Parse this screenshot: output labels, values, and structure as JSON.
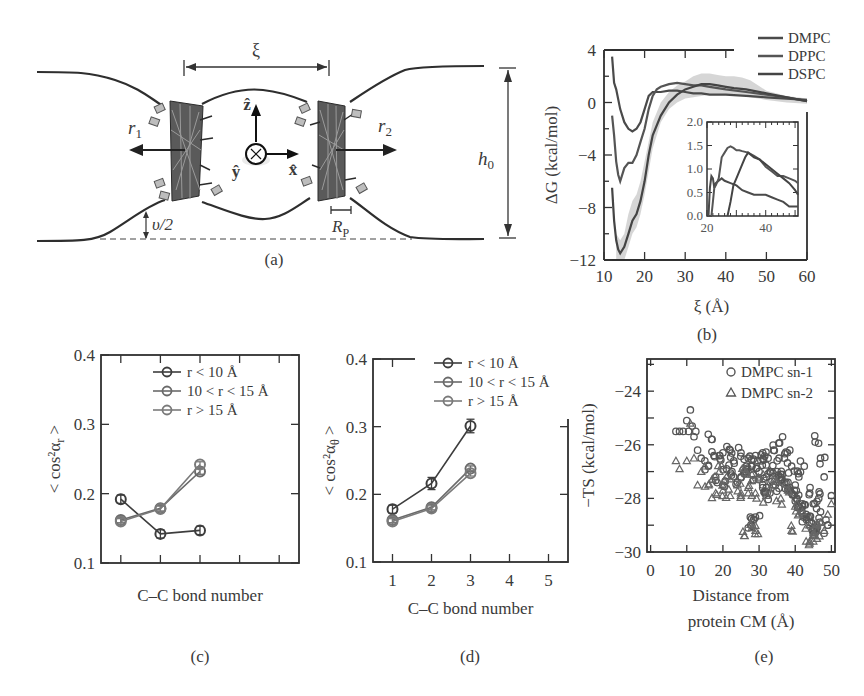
{
  "figure": {
    "panels": {
      "a": {
        "label": "(a)",
        "xi_label": "ξ",
        "r1_label": "r",
        "r1_sub": "1",
        "r2_label": "r",
        "r2_sub": "2",
        "z_label": "ẑ",
        "x_label": "x̂",
        "y_label": "ŷ",
        "h0_label": "h",
        "h0_sub": "0",
        "v_label": "υ/2",
        "rp_label": "R",
        "rp_sub": "P"
      },
      "b": {
        "label": "(b)"
      },
      "c": {
        "label": "(c)"
      },
      "d": {
        "label": "(d)"
      },
      "e": {
        "label": "(e)"
      }
    }
  },
  "colors": {
    "ink": "#3a3a3a",
    "dmpc": "#4a4a4a",
    "dppc": "#555555",
    "dspc": "#444444",
    "band": "#cfcfcf",
    "marker_dark": "#3d3d3d",
    "marker_mid": "#6a6a6a",
    "marker_light": "#7a7a7a"
  },
  "chart_data": [
    {
      "id": "b",
      "type": "line",
      "title": "",
      "xlabel": "ξ (Å)",
      "ylabel": "ΔG (kcal/mol)",
      "xlim": [
        10,
        60
      ],
      "ylim": [
        -12,
        4
      ],
      "xticks": [
        10,
        20,
        30,
        40,
        50,
        60
      ],
      "yticks": [
        4,
        0,
        -4,
        -8,
        -12
      ],
      "legend": [
        "DMPC",
        "DPPC",
        "DSPC"
      ],
      "legend_position": "top-right outside",
      "series": [
        {
          "name": "DMPC",
          "x": [
            12,
            12.5,
            13,
            14,
            15,
            16,
            17,
            18,
            19,
            20,
            21,
            22,
            24,
            26,
            28,
            30,
            32,
            34,
            36,
            38,
            40,
            45,
            50,
            55,
            60
          ],
          "y": [
            3.5,
            1.5,
            1.0,
            -0.5,
            -1.5,
            -2.0,
            -2.2,
            -2.0,
            -1.5,
            -0.5,
            0.5,
            0.8,
            0.8,
            0.9,
            0.9,
            0.8,
            0.7,
            0.7,
            0.6,
            0.6,
            0.6,
            0.5,
            0.4,
            0.3,
            0.2
          ]
        },
        {
          "name": "DPPC",
          "x": [
            12,
            12.5,
            13,
            13.5,
            14,
            15,
            16,
            17,
            18,
            19,
            20,
            21,
            22,
            23,
            24,
            26,
            28,
            30,
            32,
            34,
            36,
            38,
            40,
            45,
            50,
            55,
            60
          ],
          "y": [
            -1.0,
            -2.5,
            -4.5,
            -5.5,
            -6.0,
            -5.0,
            -4.6,
            -4.6,
            -4.0,
            -3.0,
            -2.0,
            -0.5,
            0.5,
            1.0,
            1.2,
            1.4,
            1.5,
            1.4,
            1.3,
            1.3,
            1.2,
            1.1,
            1.0,
            0.8,
            0.6,
            0.4,
            0.1
          ]
        },
        {
          "name": "DSPC",
          "x": [
            12,
            12.5,
            13,
            13.5,
            14,
            15,
            16,
            17,
            18,
            19,
            20,
            21,
            22,
            24,
            26,
            28,
            30,
            32,
            34,
            36,
            38,
            40,
            42,
            45,
            50,
            55,
            60
          ],
          "y": [
            -6.5,
            -9.0,
            -10.5,
            -11.2,
            -11.5,
            -11.0,
            -10.0,
            -9.0,
            -8.5,
            -7.5,
            -6.0,
            -4.0,
            -2.5,
            -1.0,
            0.0,
            0.6,
            1.0,
            1.2,
            1.4,
            1.4,
            1.3,
            1.2,
            1.1,
            1.0,
            0.7,
            0.4,
            0.1
          ]
        }
      ],
      "band": {
        "name": "DSPC uncertainty",
        "x": [
          13,
          14,
          15,
          16,
          17,
          18,
          19,
          20,
          22,
          24,
          26,
          28,
          30,
          32,
          34,
          36,
          38,
          40,
          42,
          44,
          46,
          48,
          50,
          55,
          60
        ],
        "lower": [
          -12,
          -12,
          -12,
          -11,
          -10,
          -9.5,
          -8.5,
          -7,
          -3.5,
          -1.5,
          -0.5,
          0,
          0.3,
          0.4,
          0.5,
          0.6,
          0.6,
          0.6,
          0.6,
          0.5,
          0.4,
          0.3,
          0.2,
          0,
          -0.1
        ],
        "upper": [
          -10,
          -10.5,
          -10,
          -8.5,
          -7.5,
          -7,
          -6,
          -4.5,
          -1.5,
          0,
          0.8,
          1.3,
          1.6,
          2.0,
          2.2,
          2.2,
          2.1,
          2.0,
          2.0,
          1.9,
          1.7,
          1.3,
          0.9,
          0.5,
          0.3
        ]
      },
      "inset": {
        "xlim": [
          20,
          51
        ],
        "ylim": [
          0,
          2
        ],
        "xticks": [
          20,
          40
        ],
        "yticks": [
          2.0,
          1.5,
          1.0,
          0.5,
          0.0
        ],
        "series": [
          {
            "name": "DMPC",
            "x": [
              20.5,
              21,
              21.5,
              22,
              22.5,
              23,
              24,
              25,
              26,
              28,
              30,
              32,
              34,
              36,
              38,
              40,
              42,
              44,
              46,
              48,
              50,
              51
            ],
            "y": [
              0,
              0.6,
              0.85,
              0.8,
              0.6,
              0.7,
              0.75,
              0.8,
              0.75,
              0.7,
              0.65,
              0.55,
              0.5,
              0.45,
              0.45,
              0.45,
              0.4,
              0.35,
              0.3,
              0.2,
              0.2,
              0.2
            ]
          },
          {
            "name": "DPPC",
            "x": [
              21.5,
              22,
              22.5,
              23,
              24,
              25,
              26,
              27,
              28,
              29,
              30,
              31,
              32,
              34,
              36,
              38,
              40,
              42,
              44,
              46,
              48,
              50,
              51
            ],
            "y": [
              0,
              0.3,
              0.6,
              0.65,
              0.8,
              1.25,
              1.35,
              1.45,
              1.48,
              1.45,
              1.4,
              1.4,
              1.38,
              1.35,
              1.28,
              1.2,
              1.05,
              0.95,
              0.85,
              0.85,
              0.8,
              0.75,
              0.7
            ]
          },
          {
            "name": "DSPC",
            "x": [
              27,
              28,
              29,
              30,
              31,
              32,
              33,
              34,
              35,
              36,
              38,
              40,
              42,
              44,
              46,
              48,
              50,
              51
            ],
            "y": [
              0,
              0.3,
              0.65,
              0.8,
              0.95,
              1.1,
              1.25,
              1.35,
              1.3,
              1.25,
              1.2,
              1.1,
              1.0,
              0.9,
              0.8,
              0.7,
              0.55,
              0.45
            ]
          }
        ]
      }
    },
    {
      "id": "c",
      "type": "line",
      "xlabel": "C–C bond number",
      "ylabel": "< cos²α_r >",
      "xlim": [
        0.5,
        5.5
      ],
      "ylim": [
        0.1,
        0.4
      ],
      "xticks": [
        1,
        2,
        3,
        4,
        5
      ],
      "xtick_labels_visible": false,
      "yticks": [
        0.1,
        0.2,
        0.3,
        0.4
      ],
      "legend": [
        "r < 10 Å",
        "10 < r < 15 Å",
        "r > 15 Å"
      ],
      "legend_position": "upper right inside",
      "categories": [
        1,
        2,
        3
      ],
      "series": [
        {
          "name": "r < 10 Å",
          "values": [
            0.192,
            0.142,
            0.147
          ],
          "err": [
            0.006,
            0.006,
            0.006
          ]
        },
        {
          "name": "10 < r < 15 Å",
          "values": [
            0.162,
            0.179,
            0.232
          ],
          "err": [
            0.004,
            0.004,
            0.004
          ]
        },
        {
          "name": "r > 15 Å",
          "values": [
            0.16,
            0.178,
            0.242
          ],
          "err": [
            0.004,
            0.004,
            0.004
          ]
        }
      ]
    },
    {
      "id": "d",
      "type": "line",
      "xlabel": "C–C bond number",
      "ylabel": "< cos²α_θ >",
      "xlim": [
        0.5,
        5.5
      ],
      "ylim": [
        0.1,
        0.4
      ],
      "xticks": [
        1,
        2,
        3,
        4,
        5
      ],
      "yticks": [
        0.1,
        0.2,
        0.3,
        0.4
      ],
      "legend": [
        "r < 10 Å",
        "10 < r < 15 Å",
        "r > 15 Å"
      ],
      "legend_position": "upper right",
      "categories": [
        1,
        2,
        3
      ],
      "series": [
        {
          "name": "r < 10 Å",
          "values": [
            0.178,
            0.216,
            0.301
          ],
          "err": [
            0.006,
            0.009,
            0.01
          ]
        },
        {
          "name": "10 < r < 15 Å",
          "values": [
            0.162,
            0.181,
            0.238
          ],
          "err": [
            0.004,
            0.004,
            0.004
          ]
        },
        {
          "name": "r > 15 Å",
          "values": [
            0.16,
            0.179,
            0.231
          ],
          "err": [
            0.004,
            0.004,
            0.004
          ]
        }
      ]
    },
    {
      "id": "e",
      "type": "scatter",
      "xlabel": "Distance from protein CM (Å)",
      "ylabel": "−TS (kcal/mol)",
      "xlim": [
        -1,
        51
      ],
      "ylim": [
        -30,
        -22.8
      ],
      "xticks": [
        0,
        10,
        20,
        30,
        40,
        50
      ],
      "yticks": [
        -24,
        -26,
        -28,
        -30
      ],
      "legend": [
        "DMPC sn-1",
        "DMPC sn-2"
      ],
      "legend_position": "upper right inside",
      "series": [
        {
          "name": "DMPC sn-1",
          "marker": "circle",
          "x": [
            7,
            8,
            9,
            10,
            10.5,
            11,
            11.5,
            12,
            12.5,
            13,
            14,
            15,
            16,
            17,
            17.5,
            18,
            19,
            20,
            21,
            22,
            22.5,
            23,
            24,
            25,
            26,
            26.5,
            27,
            28,
            28.5,
            29,
            30,
            30.5,
            31,
            32,
            32.5,
            33,
            34,
            34.5,
            35,
            36,
            36.5,
            37,
            38,
            38.5,
            39,
            40,
            40.5,
            41,
            42,
            42.5,
            43,
            44,
            44.5,
            45,
            45.5,
            46,
            46.5,
            47,
            48,
            48.5,
            49,
            50,
            20,
            25,
            28,
            31,
            33,
            35,
            37,
            39,
            41,
            43,
            45,
            47,
            49,
            30,
            32,
            34,
            36,
            38,
            40,
            42,
            44,
            46,
            48,
            27,
            28.5,
            29
          ],
          "y": [
            -25.5,
            -25.5,
            -25.5,
            -25.1,
            -25.5,
            -24.7,
            -25.3,
            -25.7,
            -25.5,
            -26.2,
            -26.5,
            -26.6,
            -26.8,
            -25.8,
            -26.4,
            -27.2,
            -26.4,
            -26.3,
            -26.9,
            -26.2,
            -27,
            -26.6,
            -27.4,
            -26.3,
            -27,
            -26.8,
            -26.5,
            -26.8,
            -27.3,
            -26.4,
            -27,
            -26.6,
            -26.3,
            -27.2,
            -26.5,
            -27,
            -26.2,
            -27.5,
            -26.6,
            -27.3,
            -25.7,
            -26.5,
            -27.4,
            -26.2,
            -26.8,
            -27.5,
            -28,
            -27.2,
            -28.3,
            -26.8,
            -28.6,
            -27.8,
            -28.9,
            -28.2,
            -25.9,
            -29.1,
            -28,
            -26.5,
            -27.2,
            -28.8,
            -29,
            -27.9,
            -27.5,
            -27.2,
            -26.8,
            -27.6,
            -27.8,
            -27,
            -27.4,
            -27.8,
            -28.3,
            -28.7,
            -29.2,
            -28.5,
            -29.0,
            -27.3,
            -27.6,
            -27.5,
            -27.1,
            -27.7,
            -28.1,
            -28.2,
            -28.9,
            -29.1,
            -29.3,
            -29.1,
            -28.8,
            -28.7
          ]
        },
        {
          "name": "DMPC sn-2",
          "marker": "triangle",
          "x": [
            7,
            8,
            10,
            11,
            12,
            13,
            14,
            15,
            16,
            17,
            18,
            19,
            20,
            21,
            22,
            24,
            25,
            26,
            27,
            28,
            29,
            30,
            32,
            34,
            36,
            38,
            40,
            42,
            44,
            45,
            46,
            47,
            48,
            49,
            50,
            26,
            28,
            29,
            39,
            44,
            46
          ],
          "y": [
            -26.6,
            -26.9,
            -26.6,
            -25.2,
            -26.5,
            -27.5,
            -27,
            -26.8,
            -27.5,
            -27.3,
            -27.8,
            -27,
            -27.7,
            -27.2,
            -27.9,
            -27.5,
            -27.8,
            -26.9,
            -27.6,
            -27.1,
            -27.8,
            -27.3,
            -27.9,
            -27.5,
            -28,
            -27.7,
            -28.3,
            -28.5,
            -29,
            -29.6,
            -29.2,
            -28.9,
            -29.2,
            -28.6,
            -28.2,
            -29.4,
            -29.1,
            -29.2,
            -29.2,
            -29.6,
            -29.5
          ]
        }
      ]
    }
  ]
}
